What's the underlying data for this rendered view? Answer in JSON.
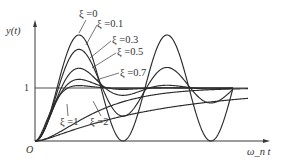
{
  "chart_data": {
    "type": "line",
    "title": "",
    "xlabel": "ω_n t",
    "ylabel": "y(t)",
    "origin_label": "O",
    "y_tick_labels": [
      "1"
    ],
    "reference_line": {
      "y": 1
    },
    "ylim": [
      0,
      2.1
    ],
    "grid": false,
    "legend": "inline labels with leader lines",
    "series": [
      {
        "name": "ξ=0",
        "zeta": 0,
        "label": "ξ =0"
      },
      {
        "name": "ξ=0.1",
        "zeta": 0.1,
        "label": "ξ =0.1"
      },
      {
        "name": "ξ=0.3",
        "zeta": 0.3,
        "label": "ξ =0.3"
      },
      {
        "name": "ξ=0.5",
        "zeta": 0.5,
        "label": "ξ =0.5"
      },
      {
        "name": "ξ=0.7",
        "zeta": 0.7,
        "label": "ξ =0.7"
      },
      {
        "name": "ξ=1",
        "zeta": 1,
        "label": "ξ =1"
      },
      {
        "name": "ξ=2",
        "zeta": 2,
        "label": "ξ =2"
      }
    ],
    "approx_peaks": [
      {
        "series": "ξ=0",
        "y_first_peak": 2.0
      },
      {
        "series": "ξ=0.1",
        "y_first_peak": 1.73
      },
      {
        "series": "ξ=0.3",
        "y_first_peak": 1.37
      },
      {
        "series": "ξ=0.5",
        "y_first_peak": 1.16
      },
      {
        "series": "ξ=0.7",
        "y_first_peak": 1.05
      }
    ]
  }
}
